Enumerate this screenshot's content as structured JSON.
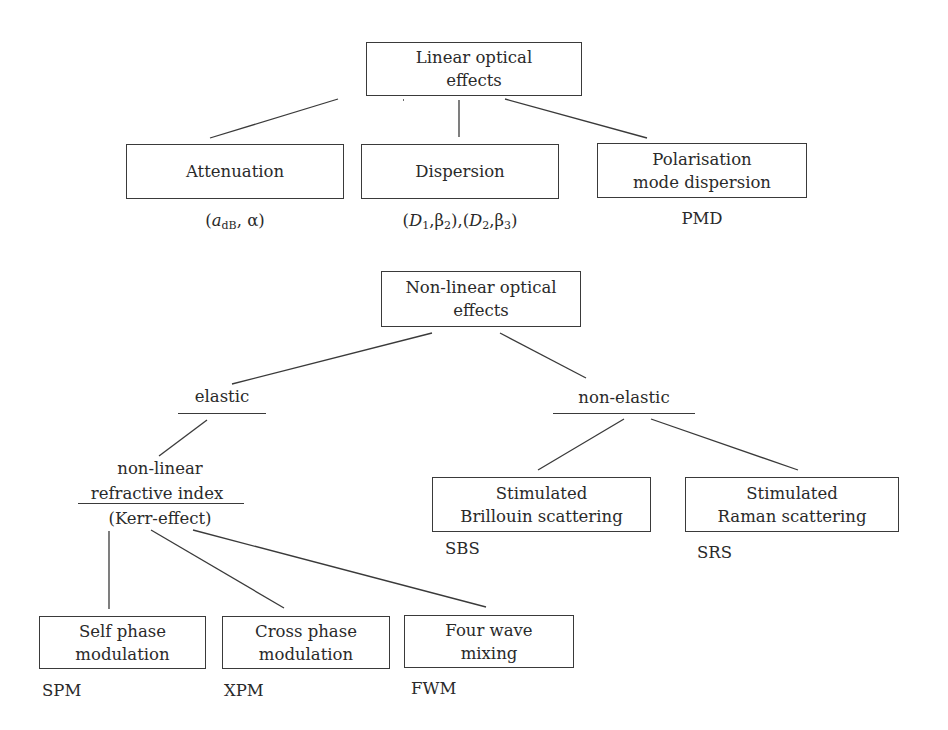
{
  "linear": {
    "root": {
      "line1": "Linear optical",
      "line2": "effects"
    },
    "children": [
      {
        "label": "Attenuation",
        "params": {
          "open": "(",
          "a": "a",
          "a_sub": "dB",
          "sep": ", ",
          "alpha": "α",
          "close": ")"
        }
      },
      {
        "label": "Dispersion",
        "params": {
          "p1_open": "(",
          "D1": "D",
          "D1_sub": "1",
          "comma1": ",",
          "b2": "β",
          "b2_sub": "2",
          "p1_close": ")",
          "mid": ",",
          "p2_open": "(",
          "D2": "D",
          "D2_sub": "2",
          "comma2": ",",
          "b3": "β",
          "b3_sub": "3",
          "p2_close": ")"
        }
      },
      {
        "line1": "Polarisation",
        "line2": "mode dispersion",
        "abbr": "PMD"
      }
    ]
  },
  "nonlinear": {
    "root": {
      "line1": "Non-linear optical",
      "line2": "effects"
    },
    "elastic": {
      "label": "elastic",
      "kerr": {
        "line1": "non-linear",
        "line2": "refractive index",
        "line3": "(Kerr-effect)"
      },
      "children": [
        {
          "line1": "Self phase",
          "line2": "modulation",
          "abbr": "SPM"
        },
        {
          "line1": "Cross phase",
          "line2": "modulation",
          "abbr": "XPM"
        },
        {
          "line1": "Four wave",
          "line2": "mixing",
          "abbr": "FWM"
        }
      ]
    },
    "non_elastic": {
      "label": "non-elastic",
      "children": [
        {
          "line1": "Stimulated",
          "line2": "Brillouin scattering",
          "abbr": "SBS"
        },
        {
          "line1": "Stimulated",
          "line2": "Raman scattering",
          "abbr": "SRS"
        }
      ]
    }
  }
}
